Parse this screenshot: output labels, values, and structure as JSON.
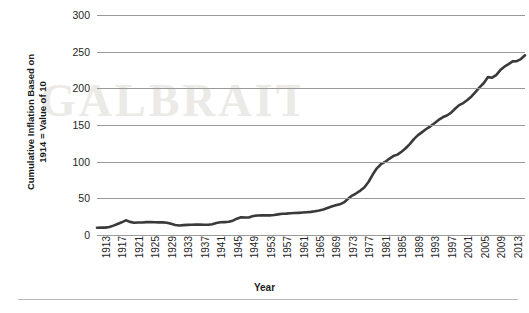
{
  "chart_data": {
    "type": "line",
    "title": "",
    "xlabel": "Year",
    "ylabel": "Cumulative Inflation Based on 1914 = Value of 10",
    "ylim": [
      0,
      300
    ],
    "yticks": [
      0,
      50,
      100,
      150,
      200,
      250,
      300
    ],
    "xlim": [
      1913,
      2017
    ],
    "xticks": [
      1913,
      1917,
      1921,
      1925,
      1929,
      1933,
      1937,
      1941,
      1945,
      1949,
      1953,
      1957,
      1961,
      1965,
      1969,
      1973,
      1977,
      1981,
      1985,
      1989,
      1993,
      1997,
      2001,
      2005,
      2009,
      2013,
      2017
    ],
    "grid": true,
    "legend": false,
    "line_color": "#3a3a3a",
    "gridline_color": "#9a9a9a",
    "series": [
      {
        "name": "Cumulative Inflation",
        "x": [
          1913,
          1914,
          1915,
          1916,
          1917,
          1918,
          1919,
          1920,
          1921,
          1922,
          1923,
          1924,
          1925,
          1926,
          1927,
          1928,
          1929,
          1930,
          1931,
          1932,
          1933,
          1934,
          1935,
          1936,
          1937,
          1938,
          1939,
          1940,
          1941,
          1942,
          1943,
          1944,
          1945,
          1946,
          1947,
          1948,
          1949,
          1950,
          1951,
          1952,
          1953,
          1954,
          1955,
          1956,
          1957,
          1958,
          1959,
          1960,
          1961,
          1962,
          1963,
          1964,
          1965,
          1966,
          1967,
          1968,
          1969,
          1970,
          1971,
          1972,
          1973,
          1974,
          1975,
          1976,
          1977,
          1978,
          1979,
          1980,
          1981,
          1982,
          1983,
          1984,
          1985,
          1986,
          1987,
          1988,
          1989,
          1990,
          1991,
          1992,
          1993,
          1994,
          1995,
          1996,
          1997,
          1998,
          1999,
          2000,
          2001,
          2002,
          2003,
          2004,
          2005,
          2006,
          2007,
          2008,
          2009,
          2010,
          2011,
          2012,
          2013,
          2014,
          2015,
          2016,
          2017
        ],
        "values": [
          9.9,
          10.0,
          10.1,
          10.9,
          12.8,
          15.1,
          17.3,
          20.0,
          17.9,
          16.8,
          17.1,
          17.1,
          17.6,
          17.7,
          17.4,
          17.2,
          17.2,
          16.8,
          15.3,
          13.7,
          13.0,
          13.4,
          13.8,
          13.9,
          14.4,
          14.1,
          13.9,
          14.0,
          14.7,
          16.3,
          17.3,
          17.6,
          18.0,
          19.5,
          22.3,
          24.1,
          23.8,
          24.1,
          26.0,
          26.5,
          26.7,
          26.9,
          26.8,
          27.2,
          28.1,
          28.9,
          29.1,
          29.6,
          29.9,
          30.2,
          30.6,
          31.0,
          31.5,
          32.4,
          33.4,
          34.8,
          36.7,
          38.8,
          40.5,
          41.8,
          44.4,
          49.3,
          53.8,
          56.9,
          60.6,
          65.2,
          72.6,
          82.4,
          90.9,
          96.5,
          99.6,
          103.9,
          107.6,
          109.6,
          113.6,
          118.3,
          124.0,
          130.7,
          136.2,
          140.3,
          144.5,
          148.2,
          152.4,
          156.9,
          160.5,
          163.0,
          166.6,
          172.2,
          177.1,
          179.9,
          184.0,
          188.9,
          195.3,
          201.6,
          207.3,
          215.3,
          214.5,
          218.1,
          224.9,
          229.6,
          233.0,
          236.7,
          237.0,
          239.9,
          245.1
        ]
      }
    ]
  },
  "axis": {
    "y_title": "Cumulative Inflation Based on 1914 = Value of 10",
    "y_title_line1": "Cumulative Inflation Based on",
    "y_title_line2": "1914 = Value of 10",
    "x_title": "Year"
  },
  "watermark": {
    "text": "GALBRAITH"
  }
}
